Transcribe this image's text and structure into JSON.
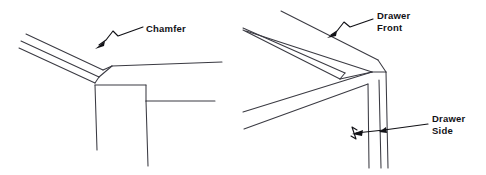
{
  "figure": {
    "background_color": "#ffffff",
    "line_color": "#3a3a42",
    "label_color": "#111116",
    "panels": [
      {
        "id": "left-panel",
        "name": "chamfer-corner-detail",
        "labels": [
          {
            "id": "chamfer",
            "name": "chamfer-label",
            "lines": [
              "Chamfer"
            ],
            "x": 146,
            "y": 30
          }
        ]
      },
      {
        "id": "right-panel",
        "name": "drawer-corner-detail",
        "labels": [
          {
            "id": "drawer-front",
            "name": "drawer-front-label",
            "lines": [
              "Drawer",
              "Front"
            ],
            "x": 377,
            "y": 17
          },
          {
            "id": "drawer-side",
            "name": "drawer-side-label",
            "lines": [
              "Drawer",
              "Side"
            ],
            "x": 432,
            "y": 122
          }
        ]
      }
    ]
  },
  "labels": {
    "chamfer": "Chamfer",
    "drawer_front_line1": "Drawer",
    "drawer_front_line2": "Front",
    "drawer_side_line1": "Drawer",
    "drawer_side_line2": "Side"
  }
}
